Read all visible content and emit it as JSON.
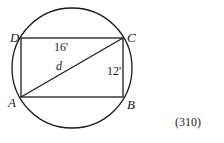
{
  "diagram": {
    "type": "geometry",
    "vertices": {
      "A": {
        "label": "A",
        "x": 21,
        "y": 97
      },
      "B": {
        "label": "B",
        "x": 123,
        "y": 97
      },
      "C": {
        "label": "C",
        "x": 123,
        "y": 38
      },
      "D": {
        "label": "D",
        "x": 21,
        "y": 38
      }
    },
    "circle": {
      "cx": 72,
      "cy": 68,
      "r": 60
    },
    "labels": {
      "top_side": "16'",
      "right_side": "12'",
      "diagonal": "d"
    },
    "figure_number": "(310)",
    "colors": {
      "stroke": "#1a1a1a",
      "background": "#ffffff"
    }
  }
}
